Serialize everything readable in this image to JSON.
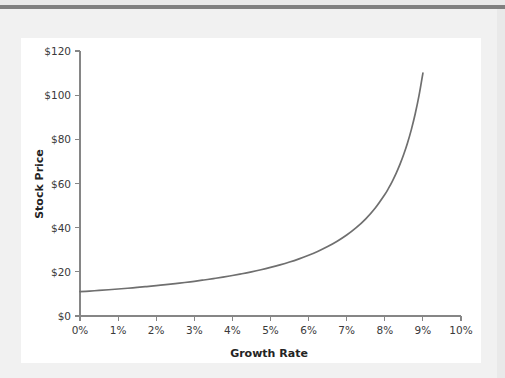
{
  "page": {
    "background_color": "#e9e9e9",
    "surface_color": "#f1f1f1",
    "top_rule_color": "#808080",
    "card_color": "#ffffff"
  },
  "chart_data": {
    "type": "line",
    "title": "",
    "xlabel": "Growth Rate",
    "ylabel": "Stock Price",
    "xlim": [
      0,
      10
    ],
    "ylim": [
      0,
      120
    ],
    "grid": false,
    "legend": null,
    "x_tick_labels": [
      "0%",
      "1%",
      "2%",
      "3%",
      "4%",
      "5%",
      "6%",
      "7%",
      "8%",
      "9%",
      "10%"
    ],
    "x_tick_values": [
      0,
      1,
      2,
      3,
      4,
      5,
      6,
      7,
      8,
      9,
      10
    ],
    "y_tick_labels": [
      "$0",
      "$20",
      "$40",
      "$60",
      "$80",
      "$100",
      "$120"
    ],
    "y_tick_values": [
      0,
      20,
      40,
      60,
      80,
      100,
      120
    ],
    "series": [
      {
        "name": "Stock Price",
        "color": "#6f6f6f",
        "line_width": 1.7,
        "x": [
          0,
          0.25,
          0.5,
          0.75,
          1,
          1.25,
          1.5,
          1.75,
          2,
          2.25,
          2.5,
          2.75,
          3,
          3.25,
          3.5,
          3.75,
          4,
          4.25,
          4.5,
          4.75,
          5,
          5.25,
          5.5,
          5.75,
          6,
          6.25,
          6.5,
          6.75,
          7,
          7.25,
          7.5,
          7.75,
          8,
          8.1,
          8.2,
          8.3,
          8.4,
          8.5,
          8.6,
          8.7,
          8.8,
          8.9,
          9
        ],
        "values": [
          11.0,
          11.28,
          11.58,
          11.89,
          12.22,
          12.57,
          12.94,
          13.33,
          13.75,
          14.19,
          14.67,
          15.17,
          15.71,
          16.3,
          16.92,
          17.6,
          18.33,
          19.13,
          20.0,
          20.95,
          22.0,
          23.16,
          24.44,
          25.88,
          27.5,
          29.33,
          31.43,
          33.85,
          36.67,
          40.0,
          44.0,
          48.89,
          55.0,
          57.89,
          61.11,
          64.71,
          68.75,
          73.33,
          78.57,
          84.62,
          91.67,
          100.0,
          110.0
        ]
      }
    ]
  },
  "axes": {
    "y_axis_label": "Stock Price",
    "x_axis_label": "Growth Rate"
  }
}
